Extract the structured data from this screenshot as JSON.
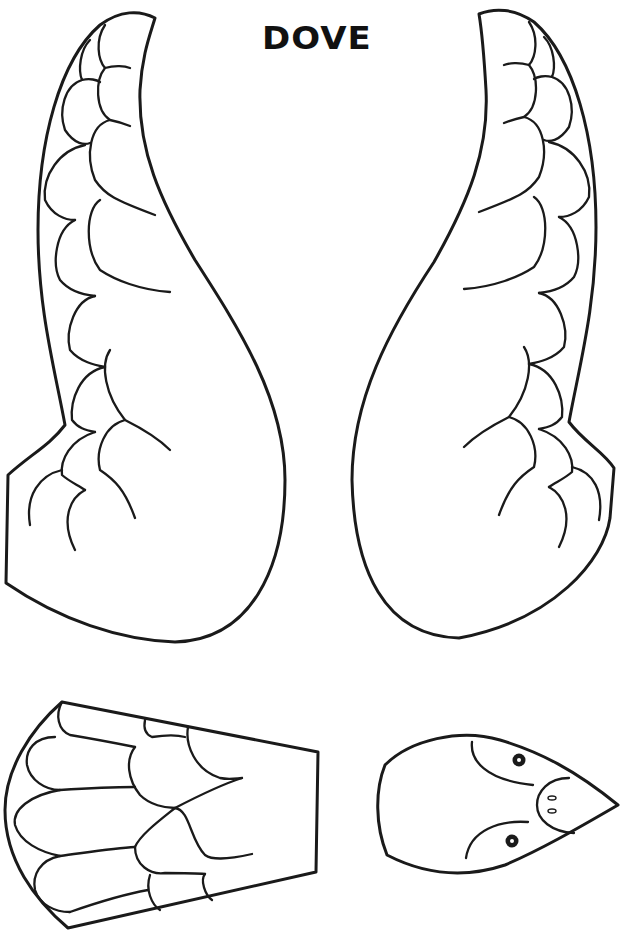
{
  "page": {
    "title": "DOVE",
    "type": "craft-template",
    "pieces": [
      {
        "name": "left-wing",
        "feather_rows": 7
      },
      {
        "name": "right-wing",
        "feather_rows": 7
      },
      {
        "name": "tail",
        "feathers": 9
      },
      {
        "name": "head",
        "features": [
          "eyes",
          "beak",
          "nostrils"
        ]
      }
    ]
  },
  "colors": {
    "line": "#1a1a1a",
    "background": "#ffffff"
  }
}
